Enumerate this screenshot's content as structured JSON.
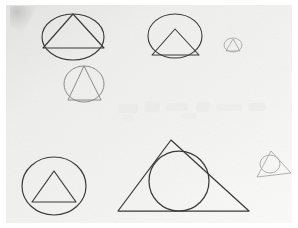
{
  "page": {
    "media": "pencil-on-paper-scan",
    "width": 298,
    "height": 228
  },
  "colors": {
    "page_background": "#ffffff",
    "paper_fill": "#f0f0ee",
    "paper_fill_shadow": "#dcdcda",
    "ink_dark": "#3a3a3a",
    "ink_medium": "#6f6f6f",
    "ink_light": "#a8a8a8",
    "ink_faint": "#c4c4c4",
    "ghost_mark": "#e6e6e4"
  },
  "paper": {
    "x": 6,
    "y": 5,
    "width": 286,
    "height": 218,
    "label": "scanned paper sheet"
  },
  "smudge": {
    "label": "pencil smudge top-left corner",
    "points": "10,6 38,6 22,34 10,26"
  },
  "ghost_marks": {
    "label": "faint bleed-through handwriting",
    "items": [
      {
        "x": 118,
        "y": 104,
        "w": 20,
        "h": 9
      },
      {
        "x": 144,
        "y": 101,
        "w": 16,
        "h": 11
      },
      {
        "x": 166,
        "y": 103,
        "w": 22,
        "h": 8
      },
      {
        "x": 196,
        "y": 102,
        "w": 14,
        "h": 10
      },
      {
        "x": 216,
        "y": 104,
        "w": 26,
        "h": 7
      },
      {
        "x": 248,
        "y": 103,
        "w": 18,
        "h": 8
      },
      {
        "x": 122,
        "y": 114,
        "w": 12,
        "h": 7
      },
      {
        "x": 182,
        "y": 113,
        "w": 15,
        "h": 6
      }
    ]
  },
  "figures": [
    {
      "id": "fig-1",
      "name": "ellipse-with-inscribed-triangle-large",
      "description": "Dark ellipse containing a triangle whose vertices touch the ellipse",
      "stroke": "#3a3a3a",
      "stroke_width": 1.15,
      "ellipse": {
        "cx": 73,
        "cy": 37,
        "rx": 31,
        "ry": 23
      },
      "triangle": {
        "points": "73,14 104,48 43,48"
      }
    },
    {
      "id": "fig-2",
      "name": "ellipse-with-inscribed-triangle-medium",
      "description": "Dark ellipse with a triangle resting on the lower chord",
      "stroke": "#3a3a3a",
      "stroke_width": 1.1,
      "ellipse": {
        "cx": 175,
        "cy": 36,
        "rx": 27,
        "ry": 22
      },
      "triangle": {
        "points": "175,29 199,55 152,55"
      }
    },
    {
      "id": "fig-3",
      "name": "circle-with-triangle-tiny-top-right",
      "description": "Very small faint circle with a small triangle inside",
      "stroke": "#a8a8a8",
      "stroke_width": 0.9,
      "ellipse": {
        "cx": 233,
        "cy": 45,
        "rx": 9,
        "ry": 7
      },
      "triangle": {
        "points": "233,39 240,51 226,51"
      }
    },
    {
      "id": "fig-4",
      "name": "circle-with-inscribed-triangle-light",
      "description": "Light pencil circle with inscribed triangle, second row left",
      "stroke": "#8a8a8a",
      "stroke_width": 1.0,
      "ellipse": {
        "cx": 84,
        "cy": 84,
        "rx": 20,
        "ry": 18
      },
      "triangle": {
        "points": "84,66 101,100 68,100"
      }
    },
    {
      "id": "fig-5",
      "name": "circle-with-inscribed-triangle-bottom-left",
      "description": "Dark circle containing a triangle, bottom-left",
      "stroke": "#3a3a3a",
      "stroke_width": 1.2,
      "ellipse": {
        "cx": 54,
        "cy": 186,
        "rx": 32,
        "ry": 29
      },
      "triangle": {
        "points": "54,171 76,202 32,202"
      }
    },
    {
      "id": "fig-6",
      "name": "triangle-with-inscribed-circle-large",
      "description": "Large triangle with a circle inscribed touching all three sides",
      "stroke": "#3a3a3a",
      "stroke_width": 1.25,
      "triangle": {
        "points": "171,140 249,211 118,211"
      },
      "ellipse": {
        "cx": 179,
        "cy": 181,
        "rx": 30,
        "ry": 30
      }
    },
    {
      "id": "fig-7",
      "name": "triangle-with-circle-tiny-bottom-right",
      "description": "Small faint triangle with a circle inside it, bottom-right",
      "stroke": "#a8a8a8",
      "stroke_width": 0.9,
      "triangle": {
        "points": "271,151 291,173 257,177"
      },
      "ellipse": {
        "cx": 270,
        "cy": 164,
        "rx": 10,
        "ry": 9
      }
    }
  ],
  "alt_text": "Scanned sheet of paper with seven hand-drawn pencil sketches of circles and triangles inscribed in one another."
}
